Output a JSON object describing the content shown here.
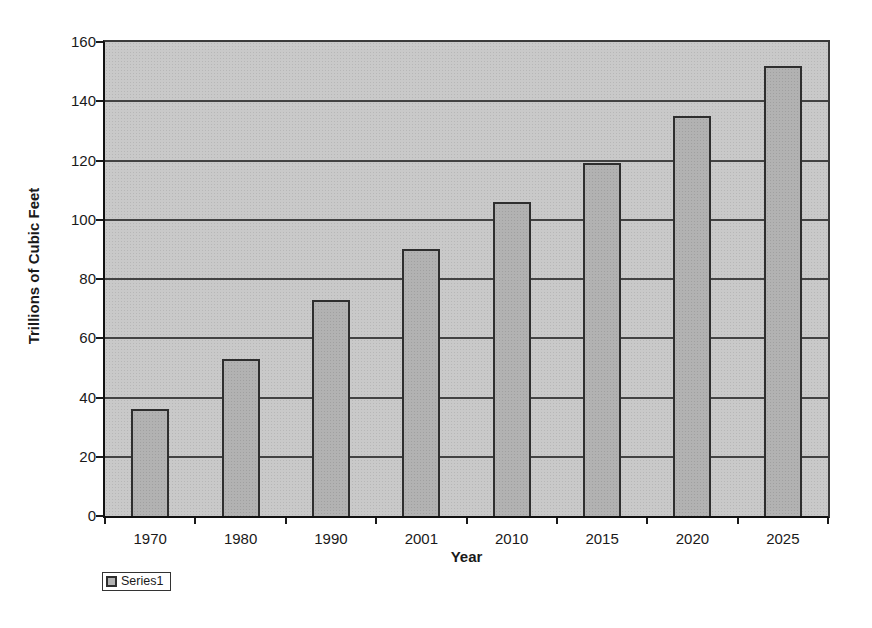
{
  "chart_data": {
    "type": "bar",
    "title": "",
    "categories": [
      "1970",
      "1980",
      "1990",
      "2001",
      "2010",
      "2015",
      "2020",
      "2025"
    ],
    "series": [
      {
        "name": "Series1",
        "values": [
          36,
          53,
          73,
          90,
          106,
          119,
          135,
          152
        ]
      }
    ],
    "xlabel": "Year",
    "ylabel": "Trillions of Cubic Feet",
    "ylim": [
      0,
      160
    ],
    "yticks": [
      0,
      20,
      40,
      60,
      80,
      100,
      120,
      140,
      160
    ],
    "grid": true,
    "legend_position": "bottom-left",
    "colors": {
      "page_bg": "#ffffff",
      "plot_bg": "#c9c9c9",
      "bar_fill": "#b2b2b2",
      "bar_border": "#2e2e2e",
      "gridline": "#424242",
      "axis": "#111111",
      "text": "#1a1a1a",
      "legend_bg": "#ffffff",
      "legend_border": "#333333"
    }
  }
}
